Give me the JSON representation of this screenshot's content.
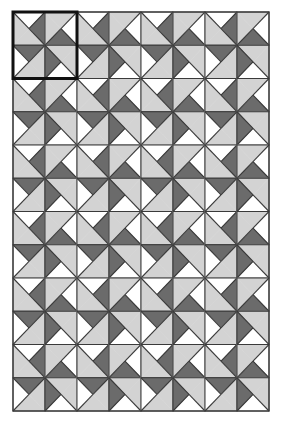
{
  "figure": {
    "grid": {
      "cols": 8,
      "rows": 12,
      "origin_x": 13,
      "origin_y": 12,
      "cell_w": 32,
      "cell_h": 33.25
    },
    "colors": {
      "light": "#d3d3d3",
      "dark": "#6b6b6b",
      "white": "#ffffff",
      "line": "#3a3a3a",
      "frame": "#111111"
    },
    "tile": {
      "note": "Each cell split by both diagonals; quadrant order top,right,bottom,left",
      "base_fill": [
        "white",
        "dark",
        "light",
        "light"
      ],
      "block_rotations": [
        [
          0,
          1
        ],
        [
          3,
          2
        ]
      ]
    },
    "highlight": {
      "label": "fundamental-block",
      "col": 0,
      "row": 0,
      "cols": 2,
      "rows": 2,
      "stroke_width": 3
    }
  }
}
